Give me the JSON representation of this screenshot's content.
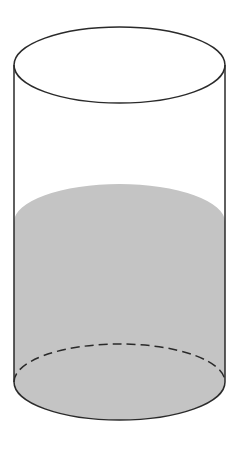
{
  "diagram": {
    "type": "cylinder",
    "colors": {
      "background": "#ffffff",
      "outline": "#2a2a2a",
      "liquid": "#c4c4c4"
    },
    "geometry": {
      "left_x": 14,
      "right_x": 225,
      "center_x": 119.5,
      "rx": 105.5,
      "ry": 38,
      "top_center_y": 65,
      "liquid_center_y": 222,
      "bottom_center_y": 382
    }
  }
}
